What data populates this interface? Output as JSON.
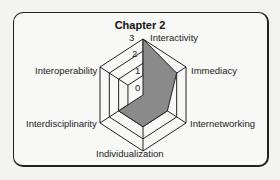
{
  "chart_data": {
    "type": "radar",
    "title": "Chapter 2",
    "axes": [
      "Interactivity",
      "Immediacy",
      "Internetworking",
      "Individualization",
      "Interdisciplinarity",
      "Interoperability"
    ],
    "values": [
      3,
      2,
      1,
      1,
      1,
      0
    ],
    "rlim": [
      0,
      3
    ],
    "ticks": [
      "0",
      "1",
      "2",
      "3"
    ],
    "fill_color": "#8a8a8a",
    "grid": true
  }
}
